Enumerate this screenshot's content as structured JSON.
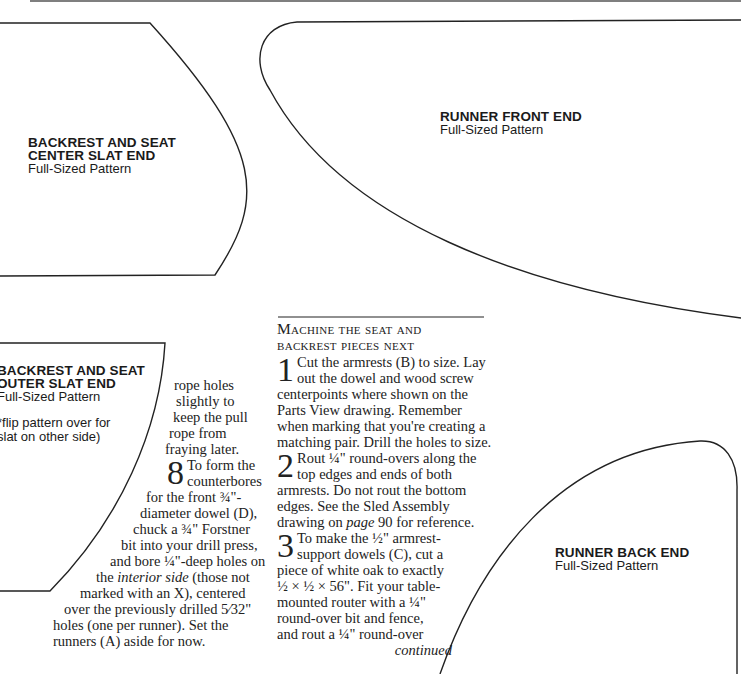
{
  "patterns": {
    "center_slat": {
      "title_line1": "BACKREST AND SEAT",
      "title_line2": "CENTER SLAT END",
      "subtitle": "Full-Sized Pattern"
    },
    "runner_front": {
      "title": "RUNNER FRONT END",
      "subtitle": "Full-Sized Pattern"
    },
    "outer_slat": {
      "title_line1": "BACKREST AND SEAT",
      "title_line2": "OUTER SLAT END",
      "subtitle": "Full-Sized Pattern",
      "note_line1": "*flip pattern over for",
      "note_line2": "slat on other side)"
    },
    "runner_back": {
      "title": "RUNNER BACK END",
      "subtitle": "Full-Sized Pattern"
    }
  },
  "left_column": {
    "lines": [
      "rope holes",
      "slightly to",
      "keep the pull",
      "rope from",
      "fraying later."
    ],
    "step8": {
      "number": "8",
      "line1": "To form the",
      "line2": "counterbores",
      "line3": "for the front ¾\"-",
      "line4": "diameter dowel (D),",
      "line5": "chuck a ¾\" Forstner",
      "line6": "bit into your drill press,",
      "line7": "and bore ¼\"-deep holes on",
      "line8_pre": "the ",
      "line8_italic": "interior side",
      "line8_post": " (those not",
      "line9": "marked with an X), centered",
      "line10": "over the previously drilled 5⁄32\"",
      "line11": "holes (one per runner). Set the",
      "line12": "runners (A) aside for now."
    }
  },
  "right_column": {
    "heading_line1": "Machine the seat and",
    "heading_line2": "backrest pieces next",
    "step1": {
      "number": "1",
      "line1": "Cut the armrests (B) to size. Lay",
      "line2": "out the dowel and wood screw",
      "line3": "centerpoints where shown on the",
      "line4": "Parts View drawing. Remember",
      "line5": "when marking that you're creating a",
      "line6": "matching pair. Drill the holes to size."
    },
    "step2": {
      "number": "2",
      "line1": "Rout ¼\" round-overs along the",
      "line2": "top edges and ends of both",
      "line3": "armrests. Do not rout the bottom",
      "line4": "edges. See the Sled Assembly",
      "line5_pre": "drawing on ",
      "line5_italic": "page",
      "line5_post": " 90 for reference."
    },
    "step3": {
      "number": "3",
      "line1": "To make the ½\" armrest-",
      "line2": "support dowels (C), cut a",
      "line3": "piece of white oak to exactly",
      "line4": "½ × ½ × 56\". Fit your table-",
      "line5": "mounted router with a ¼\"",
      "line6": "round-over bit and fence,",
      "line7": "and rout a ¼\" round-over",
      "continued": "continued"
    }
  }
}
